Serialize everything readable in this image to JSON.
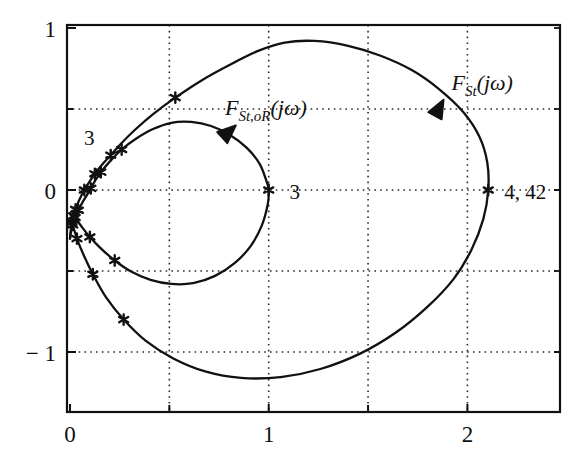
{
  "figure": {
    "kind": "nyquist-plot",
    "background": "#ffffff",
    "line_color": "#111111",
    "grid_color": "#333333",
    "frame_color": "#111111"
  },
  "axes": {
    "x_tick_labels": [
      "0",
      "1",
      "2"
    ],
    "x_tick_values": [
      0,
      1,
      2
    ],
    "x_minor_gridlines": [
      0.5,
      1.5
    ],
    "x_major_gridlines": [
      1,
      2
    ],
    "y_tick_labels": [
      "1",
      "0",
      "− 1"
    ],
    "y_tick_values": [
      1,
      0,
      -1
    ],
    "y_gridlines": [
      0.5,
      0,
      -0.5,
      -1
    ],
    "xlim": [
      -0.015,
      2.48
    ],
    "ylim": [
      -1.39,
      1.0
    ],
    "xlabel": "",
    "ylabel": ""
  },
  "annotations": [
    {
      "name": "omega-3-outer",
      "text": "3",
      "x": 0.06,
      "y": 0.34
    },
    {
      "name": "omega-3-inner",
      "text": "3",
      "x": 1.07,
      "y": 0.0
    },
    {
      "name": "omega-4-42",
      "text": "4, 42",
      "x": 2.15,
      "y": 0.0
    }
  ],
  "curve_labels": {
    "outer": {
      "name": "F_St",
      "base": "F",
      "sub": "St",
      "arg": "(jω)",
      "x": 1.92,
      "y": 0.62
    },
    "inner": {
      "name": "F_St_oR",
      "base": "F",
      "sub": "St,oR",
      "arg": "(jω)",
      "x": 0.78,
      "y": 0.46
    }
  },
  "chart_data": {
    "type": "line",
    "title": "",
    "xlabel": "",
    "ylabel": "",
    "xlim": [
      -0.015,
      2.48
    ],
    "ylim": [
      -1.39,
      1.0
    ],
    "grid": true,
    "legend": "inline-curve-labels",
    "series": [
      {
        "name": "F_St(jω)",
        "label": "F_{St}(jω)",
        "points": [
          [
            0.0,
            -0.3
          ],
          [
            0.004,
            -0.245
          ],
          [
            0.01,
            -0.2
          ],
          [
            0.018,
            -0.16
          ],
          [
            0.028,
            -0.12
          ],
          [
            0.04,
            -0.08
          ],
          [
            0.055,
            -0.04
          ],
          [
            0.072,
            0.0
          ],
          [
            0.095,
            0.045
          ],
          [
            0.125,
            0.1
          ],
          [
            0.16,
            0.155
          ],
          [
            0.205,
            0.215
          ],
          [
            0.26,
            0.29
          ],
          [
            0.33,
            0.375
          ],
          [
            0.42,
            0.47
          ],
          [
            0.53,
            0.57
          ],
          [
            0.66,
            0.675
          ],
          [
            0.8,
            0.77
          ],
          [
            0.95,
            0.86
          ],
          [
            1.08,
            0.91
          ],
          [
            1.23,
            0.92
          ],
          [
            1.4,
            0.89
          ],
          [
            1.56,
            0.83
          ],
          [
            1.72,
            0.74
          ],
          [
            1.86,
            0.62
          ],
          [
            1.98,
            0.48
          ],
          [
            2.06,
            0.33
          ],
          [
            2.1,
            0.17
          ],
          [
            2.105,
            0.0
          ],
          [
            2.08,
            -0.18
          ],
          [
            2.02,
            -0.37
          ],
          [
            1.93,
            -0.55
          ],
          [
            1.8,
            -0.72
          ],
          [
            1.64,
            -0.88
          ],
          [
            1.46,
            -1.01
          ],
          [
            1.26,
            -1.105
          ],
          [
            1.06,
            -1.155
          ],
          [
            0.86,
            -1.16
          ],
          [
            0.68,
            -1.12
          ],
          [
            0.52,
            -1.04
          ],
          [
            0.38,
            -0.93
          ],
          [
            0.27,
            -0.8
          ],
          [
            0.18,
            -0.66
          ],
          [
            0.115,
            -0.52
          ],
          [
            0.068,
            -0.4
          ],
          [
            0.035,
            -0.3
          ],
          [
            0.015,
            -0.22
          ]
        ],
        "markers": [
          [
            0.072,
            0.0
          ],
          [
            0.125,
            0.1
          ],
          [
            0.205,
            0.215
          ],
          [
            0.53,
            0.57
          ],
          [
            2.105,
            0.0
          ],
          [
            0.27,
            -0.8
          ],
          [
            0.115,
            -0.52
          ],
          [
            0.035,
            -0.3
          ],
          [
            0.018,
            -0.16
          ],
          [
            0.028,
            -0.12
          ],
          [
            0.01,
            -0.2
          ]
        ]
      },
      {
        "name": "F_St,oR(jω)",
        "label": "F_{St,oR}(jω)",
        "points": [
          [
            0.0,
            -0.3
          ],
          [
            0.006,
            -0.255
          ],
          [
            0.014,
            -0.215
          ],
          [
            0.026,
            -0.17
          ],
          [
            0.042,
            -0.125
          ],
          [
            0.062,
            -0.078
          ],
          [
            0.085,
            -0.032
          ],
          [
            0.105,
            0.01
          ],
          [
            0.125,
            0.055
          ],
          [
            0.155,
            0.11
          ],
          [
            0.2,
            0.175
          ],
          [
            0.26,
            0.25
          ],
          [
            0.33,
            0.315
          ],
          [
            0.415,
            0.375
          ],
          [
            0.51,
            0.415
          ],
          [
            0.61,
            0.42
          ],
          [
            0.71,
            0.395
          ],
          [
            0.805,
            0.34
          ],
          [
            0.89,
            0.26
          ],
          [
            0.955,
            0.16
          ],
          [
            0.99,
            0.05
          ],
          [
            1.0,
            0.0
          ],
          [
            0.995,
            -0.09
          ],
          [
            0.965,
            -0.22
          ],
          [
            0.91,
            -0.345
          ],
          [
            0.83,
            -0.45
          ],
          [
            0.73,
            -0.53
          ],
          [
            0.62,
            -0.575
          ],
          [
            0.51,
            -0.58
          ],
          [
            0.405,
            -0.555
          ],
          [
            0.31,
            -0.505
          ],
          [
            0.225,
            -0.435
          ],
          [
            0.155,
            -0.36
          ],
          [
            0.1,
            -0.29
          ],
          [
            0.058,
            -0.225
          ],
          [
            0.028,
            -0.175
          ],
          [
            0.01,
            -0.13
          ]
        ],
        "markers": [
          [
            0.105,
            0.01
          ],
          [
            0.155,
            0.11
          ],
          [
            0.26,
            0.25
          ],
          [
            1.0,
            0.0
          ],
          [
            0.225,
            -0.435
          ],
          [
            0.1,
            -0.29
          ],
          [
            0.042,
            -0.125
          ],
          [
            0.026,
            -0.17
          ],
          [
            0.014,
            -0.215
          ]
        ]
      }
    ],
    "arrow_markers": [
      {
        "series": "F_St(jω)",
        "x": 1.855,
        "y": 0.5,
        "angle": -62
      },
      {
        "series": "F_St,oR(jω)",
        "x": 0.795,
        "y": 0.355,
        "angle": -42
      }
    ]
  }
}
